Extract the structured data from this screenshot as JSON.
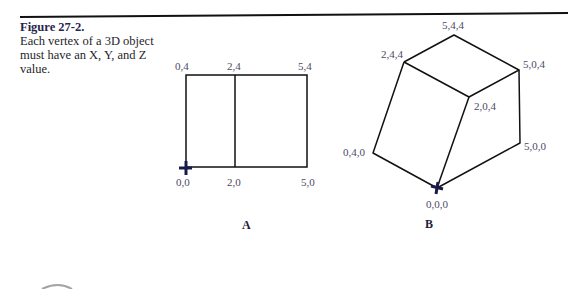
{
  "caption": {
    "figure_label": "Figure 27-2.",
    "text": "Each vertex of a 3D object must have an X, Y, and Z value."
  },
  "panel_a": {
    "label": "A",
    "vertices": [
      {
        "name": "0,4",
        "x": 186,
        "y": 75
      },
      {
        "name": "2,4",
        "x": 235,
        "y": 75
      },
      {
        "name": "5,4",
        "x": 307,
        "y": 75
      },
      {
        "name": "0,0",
        "x": 186,
        "y": 167
      },
      {
        "name": "2,0",
        "x": 235,
        "y": 167
      },
      {
        "name": "5,0",
        "x": 307,
        "y": 167
      }
    ]
  },
  "panel_b": {
    "label": "B",
    "vertices": [
      {
        "name": "5,4,4",
        "x": 454,
        "y": 35
      },
      {
        "name": "2,4,4",
        "x": 404,
        "y": 62
      },
      {
        "name": "5,0,4",
        "x": 519,
        "y": 70
      },
      {
        "name": "2,0,4",
        "x": 469,
        "y": 97
      },
      {
        "name": "0,4,0",
        "x": 373,
        "y": 153
      },
      {
        "name": "5,0,0",
        "x": 520,
        "y": 143
      },
      {
        "name": "0,0,0",
        "x": 437,
        "y": 188
      }
    ]
  },
  "colors": {
    "line": "#111111",
    "label": "#4a4a66",
    "origin_marker": "#1a1a4a"
  }
}
